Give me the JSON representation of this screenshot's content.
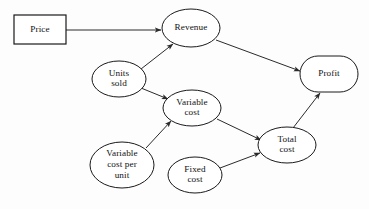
{
  "diagram": {
    "background_color": "#fdfdfd",
    "line_color": "#2b2b2b",
    "node_fill": "#ffffff",
    "node_stroke": "#1a1a1a",
    "nodes": [
      {
        "id": "price",
        "label": "Price",
        "lines": [
          "Price"
        ],
        "shape": "rectangle",
        "x": 14,
        "y": 15,
        "w": 52,
        "h": 29,
        "cx": 40,
        "cy": 29.5
      },
      {
        "id": "revenue",
        "label": "Revenue",
        "lines": [
          "Revenue"
        ],
        "shape": "ellipse",
        "cx": 191,
        "cy": 28,
        "rx": 29,
        "ry": 19
      },
      {
        "id": "units_sold",
        "label": "Units sold",
        "lines": [
          "Units",
          "sold"
        ],
        "shape": "ellipse",
        "cx": 119,
        "cy": 79,
        "rx": 27,
        "ry": 18
      },
      {
        "id": "profit",
        "label": "Profit",
        "lines": [
          "Profit"
        ],
        "shape": "stadium",
        "cx": 329,
        "cy": 74,
        "rx": 29,
        "ry": 18
      },
      {
        "id": "variable_cost",
        "label": "Variable cost",
        "lines": [
          "Variable",
          "cost"
        ],
        "shape": "ellipse",
        "cx": 192,
        "cy": 108,
        "rx": 29,
        "ry": 18
      },
      {
        "id": "total_cost",
        "label": "Total cost",
        "lines": [
          "Total",
          "cost"
        ],
        "shape": "ellipse",
        "cx": 287,
        "cy": 145,
        "rx": 29,
        "ry": 18
      },
      {
        "id": "variable_cost_per_unit",
        "label": "Variable cost per unit",
        "lines": [
          "Variable",
          "cost per",
          "unit"
        ],
        "shape": "ellipse",
        "cx": 122,
        "cy": 165,
        "rx": 32,
        "ry": 23
      },
      {
        "id": "fixed_cost",
        "label": "Fixed cost",
        "lines": [
          "Fixed",
          "cost"
        ],
        "shape": "ellipse",
        "cx": 195,
        "cy": 175,
        "rx": 27,
        "ry": 18
      }
    ],
    "edges": [
      {
        "id": "price-to-revenue",
        "from": "price",
        "to": "revenue",
        "x1": 66,
        "y1": 30,
        "x2": 161,
        "y2": 30
      },
      {
        "id": "units-sold-to-revenue",
        "from": "units_sold",
        "to": "revenue",
        "x1": 141,
        "y1": 69,
        "x2": 173,
        "y2": 44
      },
      {
        "id": "units-sold-to-variable-cost",
        "from": "units_sold",
        "to": "variable_cost",
        "x1": 141,
        "y1": 88,
        "x2": 168,
        "y2": 99
      },
      {
        "id": "revenue-to-profit",
        "from": "revenue",
        "to": "profit",
        "x1": 216,
        "y1": 40,
        "x2": 300,
        "y2": 71
      },
      {
        "id": "variable-cost-per-unit-to-variable-cost",
        "from": "variable_cost_per_unit",
        "to": "variable_cost",
        "x1": 146,
        "y1": 148,
        "x2": 171,
        "y2": 121
      },
      {
        "id": "variable-cost-to-total-cost",
        "from": "variable_cost",
        "to": "total_cost",
        "x1": 217,
        "y1": 119,
        "x2": 261,
        "y2": 140
      },
      {
        "id": "fixed-cost-to-total-cost",
        "from": "fixed_cost",
        "to": "total_cost",
        "x1": 220,
        "y1": 168,
        "x2": 260,
        "y2": 153
      },
      {
        "id": "total-cost-to-profit",
        "from": "total_cost",
        "to": "profit",
        "x1": 293,
        "y1": 128,
        "x2": 320,
        "y2": 93
      }
    ]
  }
}
